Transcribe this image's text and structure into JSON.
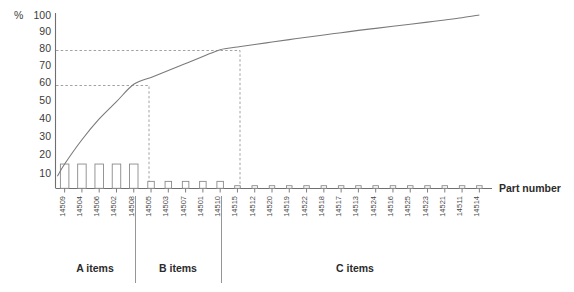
{
  "chart_data": {
    "type": "bar",
    "title": "",
    "xlabel": "Part number",
    "ylabel": "%",
    "ylim": [
      0,
      100
    ],
    "yticks": [
      10,
      20,
      30,
      40,
      50,
      60,
      70,
      80,
      90,
      100
    ],
    "grid": false,
    "legend": "none",
    "categories": [
      "14509",
      "14504",
      "14506",
      "14502",
      "14508",
      "14505",
      "14503",
      "14507",
      "14501",
      "14510",
      "14515",
      "14512",
      "14520",
      "14519",
      "14522",
      "14518",
      "14517",
      "14513",
      "14524",
      "14516",
      "14525",
      "14523",
      "14521",
      "14511",
      "14514"
    ],
    "series": [
      {
        "name": "Share of value (%)",
        "type": "bar",
        "values": [
          14,
          14,
          14,
          14,
          14,
          4,
          4,
          4,
          4,
          4,
          1.5,
          1.5,
          1.5,
          1.5,
          1.5,
          1.5,
          1.5,
          1.5,
          1.5,
          1.5,
          1.5,
          1.5,
          1.5,
          1.5,
          1.5
        ]
      },
      {
        "name": "Cumulative share (%)",
        "type": "line",
        "values": [
          14,
          28,
          40,
          50,
          60,
          64,
          68,
          72,
          76,
          80,
          81.5,
          83,
          84.4,
          85.8,
          87.2,
          88.5,
          89.8,
          91.1,
          92.3,
          93.5,
          94.7,
          95.9,
          97.1,
          98.4,
          100
        ]
      }
    ],
    "reference_lines": [
      {
        "axis": "y",
        "value": 60,
        "style": "dashed"
      },
      {
        "axis": "y",
        "value": 80,
        "style": "dashed"
      }
    ],
    "groups": [
      {
        "label": "A items",
        "count": 5
      },
      {
        "label": "B items",
        "count": 5
      },
      {
        "label": "C items",
        "count": 15
      }
    ]
  },
  "axis": {
    "y_unit": "%",
    "x_title": "Part number",
    "ytick_labels": [
      "100",
      "90",
      "80",
      "70",
      "60",
      "50",
      "40",
      "30",
      "20",
      "10"
    ]
  },
  "groups": {
    "a_label": "A items",
    "b_label": "B items",
    "c_label": "C items"
  },
  "colors": {
    "axis": "#6f6f6f",
    "bar_stroke": "#8a8a8a",
    "bar_fill": "#ffffff",
    "curve": "#7a7a7a",
    "text": "#3b3b3b",
    "background": "#ffffff"
  }
}
